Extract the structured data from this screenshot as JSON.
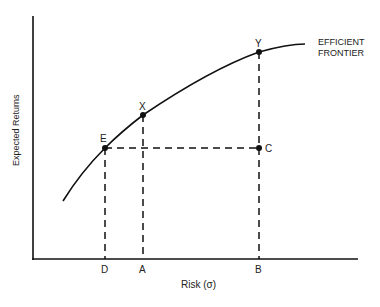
{
  "diagram": {
    "type": "efficient-frontier",
    "curve_label_line1": "EFFICIENT",
    "curve_label_line2": "FRONTIER",
    "axes": {
      "x_label": "Risk (σ)",
      "y_label": "Expected Returns"
    },
    "points": {
      "E": "E",
      "X": "X",
      "Y": "Y",
      "C": "C"
    },
    "x_ticks": {
      "D": "D",
      "A": "A",
      "B": "B"
    },
    "colors": {
      "ink": "#111111",
      "background": "#ffffff"
    }
  }
}
